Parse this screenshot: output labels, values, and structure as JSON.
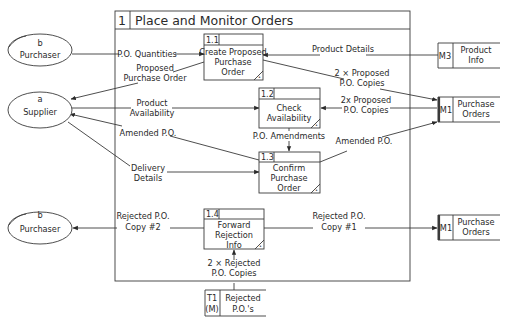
{
  "diagram": {
    "type": "data-flow-diagram",
    "process": {
      "id": "1",
      "title": "Place and Monitor Orders"
    },
    "subprocesses": [
      {
        "id": "1.1",
        "lines": [
          "Create Proposed",
          "Purchase",
          "Order"
        ]
      },
      {
        "id": "1.2",
        "lines": [
          "Check",
          "Availability"
        ]
      },
      {
        "id": "1.3",
        "lines": [
          "Confirm",
          "Purchase",
          "Order"
        ]
      },
      {
        "id": "1.4",
        "lines": [
          "Forward",
          "Rejection",
          "Info"
        ]
      }
    ],
    "external_entities": [
      {
        "id": "b",
        "name": "Purchaser",
        "duplicate": true
      },
      {
        "id": "a",
        "name": "Supplier",
        "duplicate": false
      },
      {
        "id": "b",
        "name": "Purchaser",
        "duplicate": true
      }
    ],
    "data_stores": [
      {
        "id": "M3",
        "lines": [
          "Product",
          "Info"
        ]
      },
      {
        "id": "M1",
        "lines": [
          "Purchase",
          "Orders"
        ]
      },
      {
        "id": "M1",
        "lines": [
          "Purchase",
          "Orders"
        ]
      },
      {
        "id": "T1",
        "id2": "(M)",
        "lines": [
          "Rejected",
          "P.O.'s"
        ]
      }
    ],
    "flows": [
      {
        "label": [
          "P.O. Quantities"
        ]
      },
      {
        "label": [
          "Proposed",
          "Purchase Order"
        ]
      },
      {
        "label": [
          "Product Details"
        ]
      },
      {
        "label": [
          "2 × Proposed",
          "P.O. Copies"
        ]
      },
      {
        "label": [
          "Product",
          "Availability"
        ]
      },
      {
        "label": [
          "2x Proposed",
          "P.O. Copies"
        ]
      },
      {
        "label": [
          "Amended P.O."
        ]
      },
      {
        "label": [
          "P.O. Amendments"
        ]
      },
      {
        "label": [
          "Amended P.O."
        ]
      },
      {
        "label": [
          "Delivery",
          "Details"
        ]
      },
      {
        "label": [
          "Rejected P.O.",
          "Copy #2"
        ]
      },
      {
        "label": [
          "Rejected P.O.",
          "Copy #1"
        ]
      },
      {
        "label": [
          "2 × Rejected",
          "P.O. Copies"
        ]
      }
    ]
  }
}
